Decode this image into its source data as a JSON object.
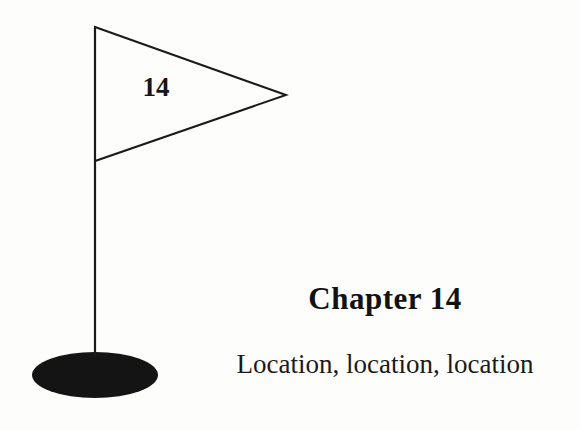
{
  "page": {
    "background_color": "#fdfdfb",
    "ink_color": "#141414",
    "width": 580,
    "height": 430
  },
  "illustration": {
    "name": "golf-flag",
    "flag_number": "14",
    "pole": {
      "color": "#1a1a1a",
      "top_y": 27,
      "bottom_y": 356,
      "x": 95
    },
    "pennant": {
      "fill": "none",
      "stroke": "#1a1a1a",
      "points": "95,27 286,95 95,161"
    },
    "base": {
      "shape": "ellipse",
      "fill": "#141414",
      "center_x": 95,
      "center_y": 375,
      "radius_x": 63,
      "radius_y": 23
    }
  },
  "chapter": {
    "heading": "Chapter 14",
    "subtitle": "Location, location, location"
  }
}
